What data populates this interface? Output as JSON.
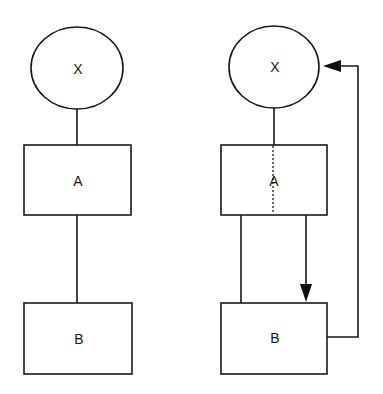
{
  "diagrams": [
    {
      "name": "left",
      "nodes": [
        {
          "id": "X",
          "label": "X",
          "shape": "ellipse"
        },
        {
          "id": "A",
          "label": "A",
          "shape": "rect"
        },
        {
          "id": "B",
          "label": "B",
          "shape": "rect"
        }
      ],
      "edges": [
        {
          "from": "X",
          "to": "A",
          "style": "solid",
          "arrow": false
        },
        {
          "from": "A",
          "to": "B",
          "style": "solid",
          "arrow": false
        }
      ]
    },
    {
      "name": "right",
      "nodes": [
        {
          "id": "X",
          "label": "X",
          "shape": "ellipse"
        },
        {
          "id": "A",
          "label": "A",
          "shape": "rect"
        },
        {
          "id": "B",
          "label": "B",
          "shape": "rect"
        }
      ],
      "edges": [
        {
          "from": "X",
          "to": "A",
          "style": "solid",
          "arrow": false
        },
        {
          "from": "X",
          "to": "A",
          "style": "dotted",
          "arrow": false,
          "note": "continues through A"
        },
        {
          "from": "A",
          "to": "B",
          "style": "solid",
          "arrow": false
        },
        {
          "from": "A",
          "to": "B",
          "style": "solid",
          "arrow": true
        },
        {
          "from": "B",
          "to": "X",
          "style": "solid",
          "arrow": true,
          "note": "feedback loop"
        }
      ]
    }
  ],
  "colors": {
    "stroke": "#1a1a1a",
    "background": "#ffffff"
  }
}
